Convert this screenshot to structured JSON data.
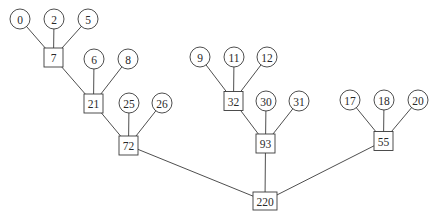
{
  "diagram": {
    "type": "tree",
    "width": 437,
    "height": 219,
    "colors": {
      "stroke": "#3a3a3a",
      "text": "#2a2a2a",
      "background": "#ffffff"
    },
    "leaf_radius": 10,
    "nodes": [
      {
        "id": "n0",
        "label": "0",
        "shape": "circle",
        "x": 20,
        "y": 19
      },
      {
        "id": "n2",
        "label": "2",
        "shape": "circle",
        "x": 54,
        "y": 19
      },
      {
        "id": "n5",
        "label": "5",
        "shape": "circle",
        "x": 88,
        "y": 19
      },
      {
        "id": "n7",
        "label": "7",
        "shape": "square",
        "x": 53.5,
        "y": 57.5,
        "w": 19,
        "h": 19
      },
      {
        "id": "n6",
        "label": "6",
        "shape": "circle",
        "x": 94,
        "y": 59
      },
      {
        "id": "n8",
        "label": "8",
        "shape": "circle",
        "x": 128,
        "y": 59
      },
      {
        "id": "n21",
        "label": "21",
        "shape": "square",
        "x": 93.5,
        "y": 103.5,
        "w": 19,
        "h": 19
      },
      {
        "id": "n25",
        "label": "25",
        "shape": "circle",
        "x": 129,
        "y": 103
      },
      {
        "id": "n26",
        "label": "26",
        "shape": "circle",
        "x": 162,
        "y": 103
      },
      {
        "id": "n72",
        "label": "72",
        "shape": "square",
        "x": 128.5,
        "y": 145.5,
        "w": 19,
        "h": 19
      },
      {
        "id": "n9",
        "label": "9",
        "shape": "circle",
        "x": 200,
        "y": 57
      },
      {
        "id": "n11",
        "label": "11",
        "shape": "circle",
        "x": 234,
        "y": 57
      },
      {
        "id": "n12",
        "label": "12",
        "shape": "circle",
        "x": 267,
        "y": 57
      },
      {
        "id": "n32",
        "label": "32",
        "shape": "square",
        "x": 233.5,
        "y": 101,
        "w": 19,
        "h": 19
      },
      {
        "id": "n30",
        "label": "30",
        "shape": "circle",
        "x": 266,
        "y": 101
      },
      {
        "id": "n31",
        "label": "31",
        "shape": "circle",
        "x": 299,
        "y": 101
      },
      {
        "id": "n93",
        "label": "93",
        "shape": "square",
        "x": 265.5,
        "y": 143.5,
        "w": 19,
        "h": 19
      },
      {
        "id": "n17",
        "label": "17",
        "shape": "circle",
        "x": 350,
        "y": 100
      },
      {
        "id": "n18",
        "label": "18",
        "shape": "circle",
        "x": 384,
        "y": 100
      },
      {
        "id": "n20",
        "label": "20",
        "shape": "circle",
        "x": 418,
        "y": 100
      },
      {
        "id": "n55",
        "label": "55",
        "shape": "square",
        "x": 383.5,
        "y": 141,
        "w": 19,
        "h": 19
      },
      {
        "id": "n220",
        "label": "220",
        "shape": "square",
        "x": 265,
        "y": 201,
        "w": 24,
        "h": 18
      }
    ],
    "edges": [
      {
        "from": "n0",
        "to": "n7"
      },
      {
        "from": "n2",
        "to": "n7"
      },
      {
        "from": "n5",
        "to": "n7"
      },
      {
        "from": "n7",
        "to": "n21"
      },
      {
        "from": "n6",
        "to": "n21"
      },
      {
        "from": "n8",
        "to": "n21"
      },
      {
        "from": "n21",
        "to": "n72"
      },
      {
        "from": "n25",
        "to": "n72"
      },
      {
        "from": "n26",
        "to": "n72"
      },
      {
        "from": "n9",
        "to": "n32"
      },
      {
        "from": "n11",
        "to": "n32"
      },
      {
        "from": "n12",
        "to": "n32"
      },
      {
        "from": "n32",
        "to": "n93"
      },
      {
        "from": "n30",
        "to": "n93"
      },
      {
        "from": "n31",
        "to": "n93"
      },
      {
        "from": "n17",
        "to": "n55"
      },
      {
        "from": "n18",
        "to": "n55"
      },
      {
        "from": "n20",
        "to": "n55"
      },
      {
        "from": "n72",
        "to": "n220"
      },
      {
        "from": "n93",
        "to": "n220"
      },
      {
        "from": "n55",
        "to": "n220"
      }
    ]
  }
}
